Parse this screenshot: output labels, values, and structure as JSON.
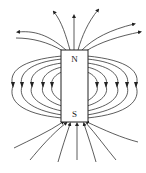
{
  "diagram": {
    "magnet": {
      "north_label": "N",
      "south_label": "S"
    },
    "colors": {
      "line": "#333333",
      "magnet_fill": "#ffffff",
      "background": "#ffffff"
    },
    "field_line_count": {
      "side_loops_each_side": 5,
      "top_lines": 7,
      "bottom_lines": 7
    }
  }
}
